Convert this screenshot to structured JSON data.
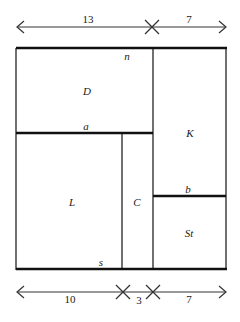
{
  "diagram": {
    "top_dimension": {
      "segments": [
        {
          "label": "13"
        },
        {
          "label": "7"
        }
      ]
    },
    "bottom_dimension": {
      "segments": [
        {
          "label": "10"
        },
        {
          "label": "3"
        },
        {
          "label": "7"
        }
      ]
    },
    "regions": [
      {
        "id": "D",
        "label": "D"
      },
      {
        "id": "K",
        "label": "K"
      },
      {
        "id": "L",
        "label": "L"
      },
      {
        "id": "C",
        "label": "C"
      },
      {
        "id": "St",
        "label": "St"
      }
    ],
    "edge_labels": {
      "n": "n",
      "a": "a",
      "b": "b",
      "s": "s"
    },
    "colors": {
      "line": "#1a1a1a",
      "background": "#ffffff"
    }
  }
}
